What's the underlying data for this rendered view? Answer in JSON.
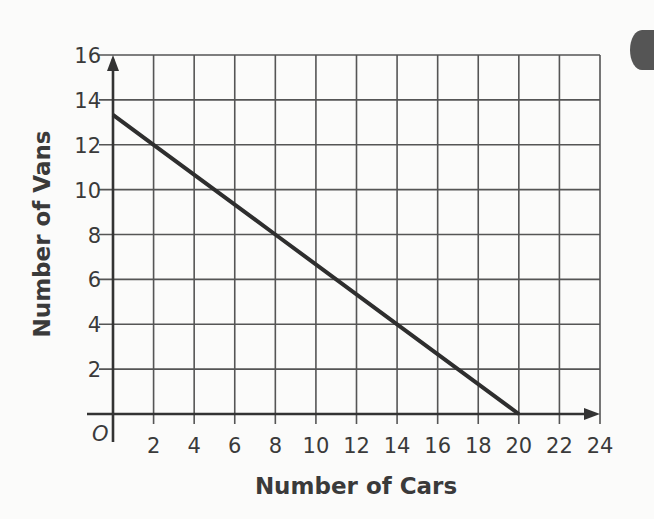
{
  "chart_data": {
    "type": "line",
    "title": "",
    "xlabel": "Number of Cars",
    "ylabel": "Number of  Vans",
    "origin_label": "O",
    "xlim": [
      0,
      24
    ],
    "ylim": [
      0,
      16
    ],
    "x_ticks": [
      2,
      4,
      6,
      8,
      10,
      12,
      14,
      16,
      18,
      20,
      22,
      24
    ],
    "y_ticks": [
      2,
      4,
      6,
      8,
      10,
      12,
      14,
      16
    ],
    "grid": true,
    "grid_step": {
      "x": 2,
      "y": 2
    },
    "legend": null,
    "series": [
      {
        "name": "Vans vs Cars",
        "x": [
          0,
          2,
          8,
          14,
          20
        ],
        "y": [
          13.33,
          12,
          8,
          4,
          0
        ],
        "color": "#2e2e2e"
      }
    ]
  },
  "colors": {
    "background": "#fbfbfa",
    "grid": "#555555",
    "line": "#2e2e2e",
    "text": "#3a3a3a"
  }
}
